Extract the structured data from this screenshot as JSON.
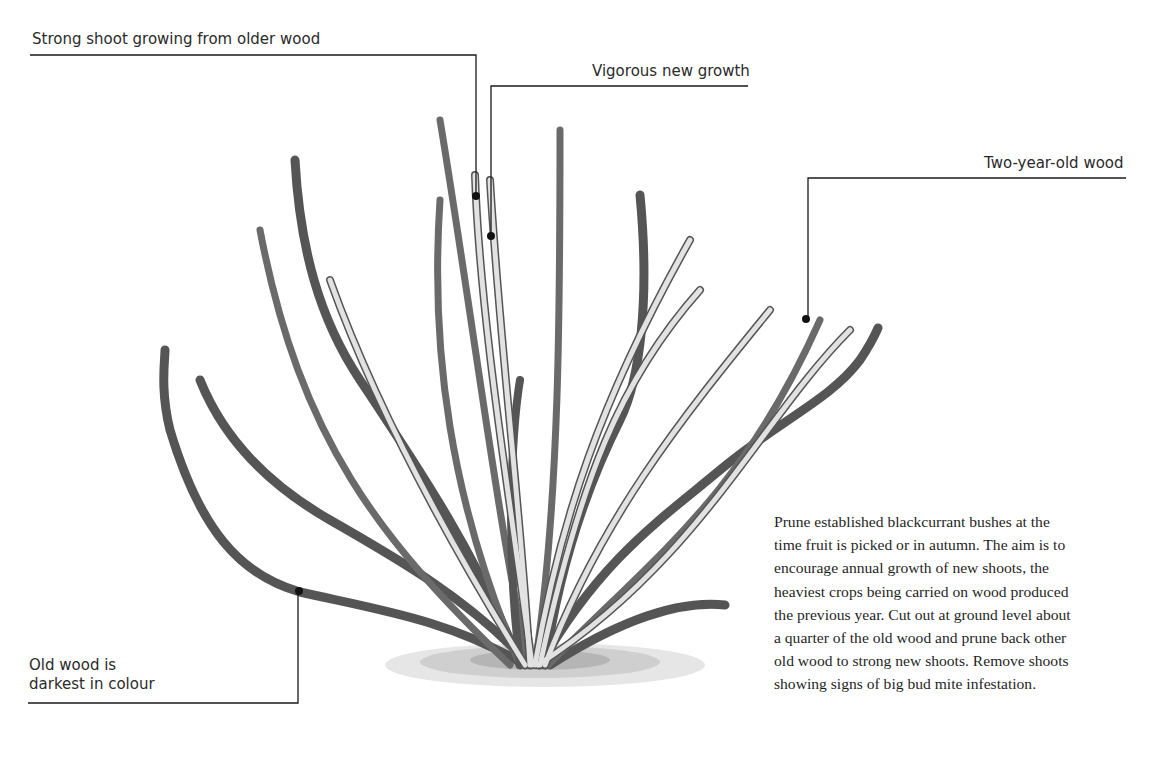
{
  "figure": {
    "labels": [
      {
        "id": "strong-shoot",
        "text": "Strong shoot growing from older wood"
      },
      {
        "id": "vigorous-growth",
        "text": "Vigorous new growth"
      },
      {
        "id": "two-year-wood",
        "text": "Two-year-old wood"
      },
      {
        "id": "old-wood",
        "lines": [
          "Old wood is",
          "darkest in colour"
        ]
      }
    ],
    "caption_lines": [
      "Prune established blackcurrant bushes at the",
      "time fruit is picked or in autumn. The aim is to",
      "encourage annual growth of new shoots, the",
      "heaviest crops being carried on wood produced",
      "the previous year. Cut out at ground level about",
      "a quarter of the old wood and prune back other",
      "old wood to strong new shoots. Remove shoots",
      "showing signs of big bud mite infestation."
    ],
    "colors": {
      "leader_line": "#1a1a1a",
      "old_wood": "#4a4a4a",
      "young_wood": "#d8d8d8",
      "stem_outline": "#555555"
    }
  }
}
